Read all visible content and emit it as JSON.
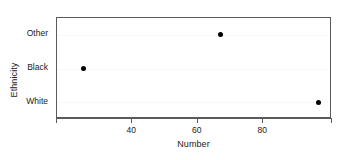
{
  "chart_data": {
    "type": "scatter",
    "title": "",
    "xlabel": "Number",
    "ylabel": "Ethnicity",
    "categories": [
      "White",
      "Black",
      "Other"
    ],
    "values": [
      97,
      25,
      67
    ],
    "points": [
      {
        "category": "Other",
        "value": 67
      },
      {
        "category": "Black",
        "value": 25
      },
      {
        "category": "White",
        "value": 97
      }
    ],
    "xlim": [
      17,
      101
    ],
    "xticks": [
      40,
      60,
      80
    ],
    "xtick_labels": [
      "40",
      "60",
      "80"
    ],
    "ytick_labels_top_to_bottom": [
      "Other",
      "Black",
      "White"
    ],
    "grid": "horizontal-dotted",
    "legend": "none",
    "marker": "filled-circle",
    "marker_color": "#000000"
  },
  "axes": {
    "x_title": "Number",
    "y_title": "Ethnicity"
  },
  "ticks": {
    "x": [
      {
        "label": "40",
        "value": 40
      },
      {
        "label": "60",
        "value": 60
      },
      {
        "label": "80",
        "value": 80
      }
    ],
    "y": [
      {
        "label": "Other",
        "value": 67
      },
      {
        "label": "Black",
        "value": 25
      },
      {
        "label": "White",
        "value": 97
      }
    ]
  }
}
